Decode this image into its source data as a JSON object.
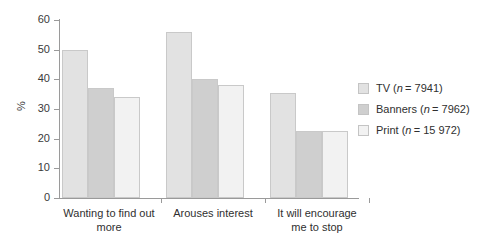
{
  "chart_data": {
    "type": "bar",
    "title": "",
    "xlabel": "",
    "ylabel": "%",
    "ylim": [
      0,
      60
    ],
    "yticks": [
      0,
      10,
      20,
      30,
      40,
      50,
      60
    ],
    "grid": false,
    "legend_position": "right",
    "categories": [
      "Wanting to find out\nmore",
      "Arouses interest",
      "It will encourage\nme to stop"
    ],
    "series": [
      {
        "name": "TV (n = 7941)",
        "label_main": "TV",
        "label_n": "7941",
        "color": "#e2e2e2",
        "values": [
          50,
          56,
          35.5
        ]
      },
      {
        "name": "Banners (n = 7962)",
        "label_main": "Banners",
        "label_n": "7962",
        "color": "#cfcfcf",
        "values": [
          37,
          40,
          22.7
        ]
      },
      {
        "name": "Print (n = 15 972)",
        "label_main": "Print",
        "label_n": "15 972",
        "color": "#f2f2f2",
        "values": [
          34,
          38,
          22.7
        ]
      }
    ]
  },
  "axis": {
    "y_labels": [
      "60",
      "50",
      "40",
      "30",
      "20",
      "10",
      "0"
    ],
    "y_title": "%"
  },
  "legend": {
    "items": [
      {
        "text": "TV (n = 7941)"
      },
      {
        "text": "Banners (n = 7962)"
      },
      {
        "text": "Print (n = 15 972)"
      }
    ]
  }
}
